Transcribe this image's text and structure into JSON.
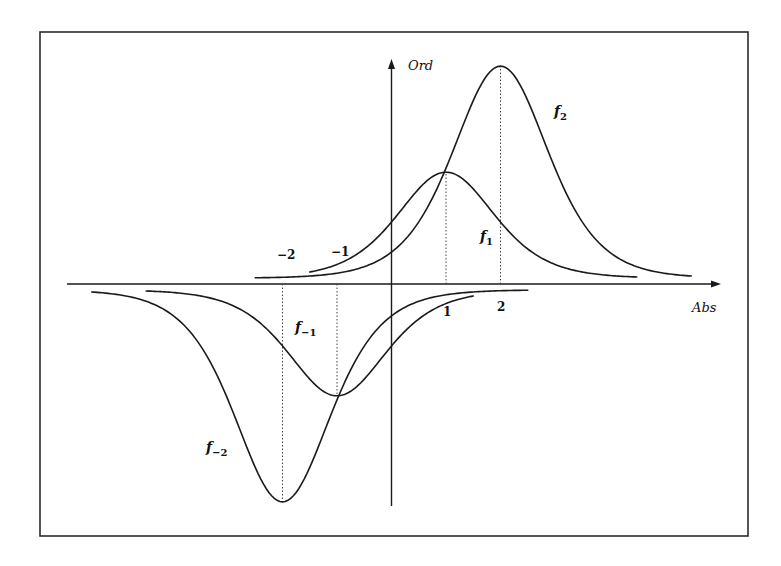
{
  "figure": {
    "x_axis_label": "Abs",
    "y_axis_label": "Ord",
    "tick_labels": [
      {
        "value": -2,
        "text": "−2"
      },
      {
        "value": -1,
        "text": "−1"
      },
      {
        "value": 1,
        "text": "1"
      },
      {
        "value": 2,
        "text": "2"
      }
    ],
    "curve_labels": {
      "f2": {
        "base": "f",
        "sub": "2"
      },
      "f1": {
        "base": "f",
        "sub": "1"
      },
      "fm1": {
        "base": "f",
        "sub": "−1"
      },
      "fm2": {
        "base": "f",
        "sub": "−2"
      }
    },
    "colors": {
      "ink": "#1a1a1a",
      "background": "#ffffff"
    }
  },
  "chart_data": {
    "type": "line",
    "title": "",
    "xlabel": "Abs",
    "ylabel": "Ord",
    "xlim": [
      -6.0,
      6.0
    ],
    "ylim": [
      -4.0,
      4.0
    ],
    "grid": false,
    "legend": "inline labels",
    "shape": "sech^2 bump: f_k(x) = k * sech^2((x - k)/w)",
    "series": [
      {
        "name": "f_2",
        "center": 2,
        "amplitude": 2,
        "width": 1.17,
        "x_range": [
          -2.5,
          5.5
        ]
      },
      {
        "name": "f_1",
        "center": 1,
        "amplitude": 1,
        "width": 1.19,
        "x_range": [
          -1.5,
          4.5
        ]
      },
      {
        "name": "f_-1",
        "center": -1,
        "amplitude": -1,
        "width": 1.19,
        "x_range": [
          -4.5,
          1.5
        ]
      },
      {
        "name": "f_-2",
        "center": -2,
        "amplitude": -2,
        "width": 1.17,
        "x_range": [
          -5.5,
          2.5
        ]
      }
    ],
    "guides": [
      {
        "x": 1,
        "to": "f_1 peak"
      },
      {
        "x": 2,
        "to": "f_2 peak"
      },
      {
        "x": -1,
        "to": "f_-1 trough"
      },
      {
        "x": -2,
        "to": "f_-2 trough"
      }
    ]
  }
}
